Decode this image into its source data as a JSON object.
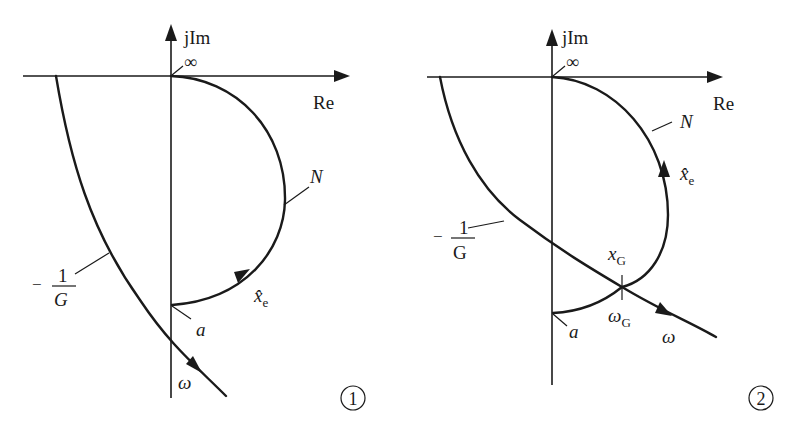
{
  "figures": [
    {
      "id": "1",
      "number_label": "1",
      "axes": {
        "imag_label": "jIm",
        "real_label": "Re",
        "origin_label": "∞"
      },
      "curves": {
        "nonlinear": {
          "label": "N",
          "start_label": "a",
          "direction_label": "x̂",
          "direction_sub": "e"
        },
        "linear": {
          "label_num": "1",
          "label_den": "G",
          "label_sign": "−",
          "direction_label": "ω"
        }
      }
    },
    {
      "id": "2",
      "number_label": "2",
      "axes": {
        "imag_label": "jIm",
        "real_label": "Re",
        "origin_label": "∞"
      },
      "curves": {
        "nonlinear": {
          "label": "N",
          "start_label": "a",
          "direction_label": "x̂",
          "direction_sub": "e"
        },
        "linear": {
          "label_num": "1",
          "label_den": "G",
          "label_sign": "−",
          "direction_label": "ω"
        }
      },
      "intersection": {
        "amp_label": "x",
        "amp_sub": "G",
        "freq_label": "ω",
        "freq_sub": "G"
      }
    }
  ]
}
